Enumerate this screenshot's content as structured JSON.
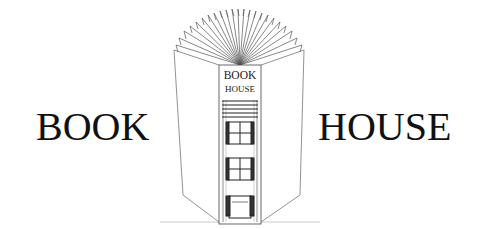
{
  "logo": {
    "left_word": "BOOK",
    "right_word": "HOUSE",
    "spine_line1": "BOOK",
    "spine_line2": "HOUSE"
  },
  "colors": {
    "ink": "#111111",
    "line": "#555555",
    "background": "#ffffff"
  }
}
